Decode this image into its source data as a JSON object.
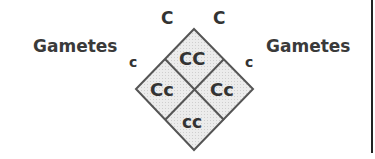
{
  "diagram": {
    "type": "punnett-square",
    "left_label": "Gametes",
    "right_label": "Gametes",
    "top_left_gamete": "C",
    "top_right_gamete": "C",
    "left_gamete": "c",
    "right_gamete": "c",
    "cells": {
      "top": "CC",
      "left": "Cc",
      "right": "Cc",
      "bottom": "cc"
    },
    "colors": {
      "fill": "#e6e6e6",
      "stroke": "#555555",
      "text": "#333333"
    }
  }
}
